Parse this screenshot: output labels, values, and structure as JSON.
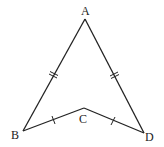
{
  "diagram": {
    "type": "geometry-quadrilateral",
    "points": {
      "A": {
        "label": "A",
        "x": 85,
        "y": 19
      },
      "B": {
        "label": "B",
        "x": 23,
        "y": 131
      },
      "C": {
        "label": "C",
        "x": 84,
        "y": 108
      },
      "D": {
        "label": "D",
        "x": 144,
        "y": 133
      }
    },
    "segments": [
      {
        "from": "A",
        "to": "B",
        "ticks": 2
      },
      {
        "from": "A",
        "to": "D",
        "ticks": 2
      },
      {
        "from": "B",
        "to": "C",
        "ticks": 1
      },
      {
        "from": "C",
        "to": "D",
        "ticks": 1
      }
    ],
    "labels": {
      "A": "A",
      "B": "B",
      "C": "C",
      "D": "D"
    }
  }
}
